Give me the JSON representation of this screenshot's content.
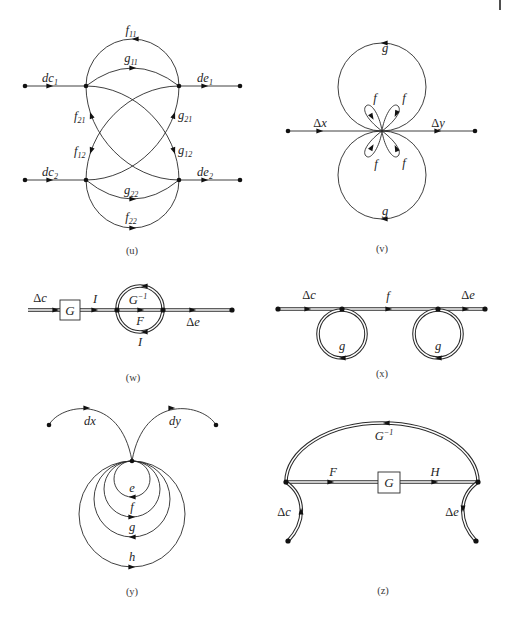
{
  "figures": {
    "u": {
      "caption": "(u)",
      "labels": {
        "dc1": {
          "base": "dc",
          "sub": "1"
        },
        "de1": {
          "base": "de",
          "sub": "1"
        },
        "dc2": {
          "base": "dc",
          "sub": "2"
        },
        "de2": {
          "base": "de",
          "sub": "2"
        },
        "f11": {
          "base": "f",
          "sub": "11"
        },
        "g11": {
          "base": "g",
          "sub": "11"
        },
        "f21": {
          "base": "f",
          "sub": "21"
        },
        "g21": {
          "base": "g",
          "sub": "21"
        },
        "f12": {
          "base": "f",
          "sub": "12"
        },
        "g12": {
          "base": "g",
          "sub": "12"
        },
        "g22": {
          "base": "g",
          "sub": "22"
        },
        "f22": {
          "base": "f",
          "sub": "22"
        }
      }
    },
    "v": {
      "caption": "(v)",
      "labels": {
        "dx": {
          "delta": "Δ",
          "var": "x"
        },
        "dy": {
          "delta": "Δ",
          "var": "y"
        },
        "g_top": "g",
        "g_bottom": "g",
        "f_upper_left": "f",
        "f_upper_right": "f",
        "f_lower_left": "f",
        "f_lower_right": "f"
      }
    },
    "w": {
      "caption": "(w)",
      "labels": {
        "dc": {
          "delta": "Δ",
          "var": "c"
        },
        "block": "G",
        "i_top": "I",
        "g_inverse": {
          "base": "G",
          "sup": "−1"
        },
        "f": "F",
        "i_bottom": "I",
        "de": {
          "delta": "Δ",
          "var": "e"
        }
      }
    },
    "x": {
      "caption": "(x)",
      "labels": {
        "dc": {
          "delta": "Δ",
          "var": "c"
        },
        "f": "f",
        "de": {
          "delta": "Δ",
          "var": "e"
        },
        "g_left": "g",
        "g_right": "g"
      }
    },
    "y": {
      "caption": "(y)",
      "labels": {
        "dx": "dx",
        "dy": "dy",
        "e": "e",
        "f": "f",
        "g": "g",
        "h": "h"
      }
    },
    "z": {
      "caption": "(z)",
      "labels": {
        "g_inverse": {
          "base": "G",
          "sup": "−1"
        },
        "f": "F",
        "block": "G",
        "h": "H",
        "dc": {
          "delta": "Δ",
          "var": "c"
        },
        "de": {
          "delta": "Δ",
          "var": "e"
        }
      }
    }
  }
}
